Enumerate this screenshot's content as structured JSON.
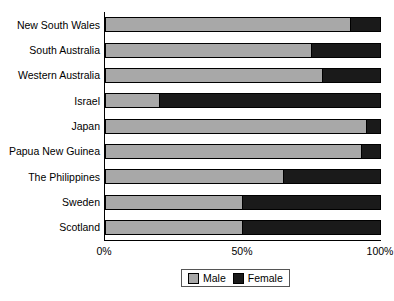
{
  "chart_data": {
    "type": "bar",
    "orientation": "horizontal",
    "stacked": true,
    "normalized": true,
    "title": "",
    "xlabel": "",
    "ylabel": "",
    "xlim": [
      0,
      100
    ],
    "grid": false,
    "legend_position": "bottom",
    "categories": [
      "New South Wales",
      "South Australia",
      "Western Australia",
      "Israel",
      "Japan",
      "Papua New Guinea",
      "The Philippines",
      "Sweden",
      "Scotland"
    ],
    "series": [
      {
        "name": "Male",
        "color": "#a8a8a8",
        "values": [
          89,
          75,
          79,
          20,
          95,
          93,
          65,
          50,
          50
        ]
      },
      {
        "name": "Female",
        "color": "#1a1a1a",
        "values": [
          11,
          25,
          21,
          80,
          5,
          7,
          35,
          50,
          50
        ]
      }
    ],
    "tick_labels": [
      "0%",
      "50%",
      "100%"
    ],
    "tick_values": [
      0,
      50,
      100
    ]
  },
  "legend": {
    "entries": [
      {
        "label": "Male",
        "swatch": "male-swatch"
      },
      {
        "label": "Female",
        "swatch": "female-swatch"
      }
    ]
  }
}
